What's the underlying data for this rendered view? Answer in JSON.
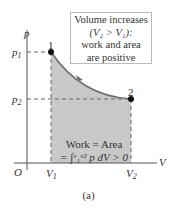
{
  "diagram": {
    "type": "pV-diagram",
    "axes": {
      "y_label": "p",
      "x_label": "V",
      "origin_label": "O"
    },
    "y_ticks": [
      {
        "label": "p",
        "sub": "1"
      },
      {
        "label": "p",
        "sub": "2"
      }
    ],
    "x_ticks": [
      {
        "label": "V",
        "sub": "1"
      },
      {
        "label": "V",
        "sub": "2"
      }
    ],
    "points": [
      {
        "label": "1"
      },
      {
        "label": "2"
      }
    ],
    "callout": {
      "line1": "Volume increases",
      "line2": "(V₂ > V₁):",
      "line3": "work and area",
      "line4": "are positive"
    },
    "area_text": {
      "line1": "Work = Area",
      "line2": "= ∫ᵛ₁ᵛ² p dV > 0"
    },
    "caption": "(a)",
    "colors": {
      "shade": "#c8c8c8",
      "curve": "#6e6e6e",
      "axis": "#444444"
    }
  }
}
